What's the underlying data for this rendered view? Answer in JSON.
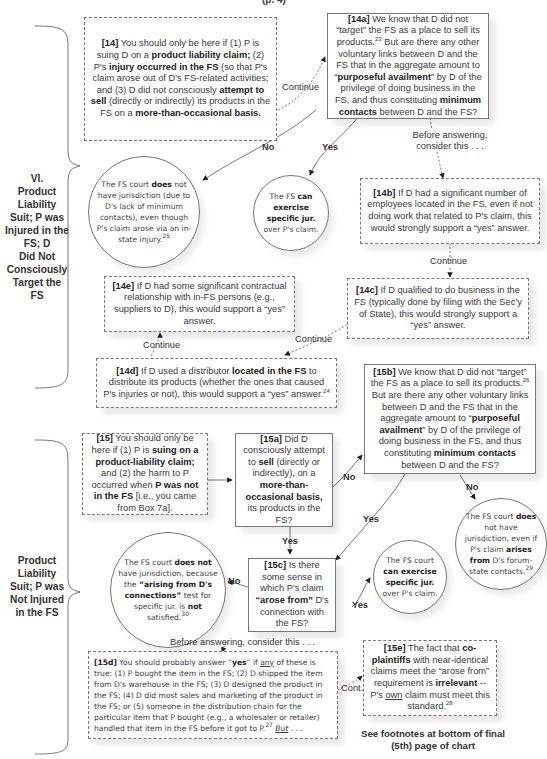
{
  "header": {
    "cut_title": "(p. 4)"
  },
  "sections": [
    {
      "id": "VI",
      "label_lines": [
        "VI.",
        "Product",
        "Liability",
        "Suit; P was",
        "Injured in the",
        "FS; D",
        "Did Not",
        "Consciously",
        "Target the",
        "FS"
      ]
    },
    {
      "id": "unnumbered",
      "label_lines": [
        "Product",
        "Liability",
        "Suit; P was",
        "Not Injured",
        "in the FS"
      ]
    }
  ],
  "boxes": {
    "b14": {
      "id": "[14]",
      "style": "dashed",
      "parts": [
        {
          "t": "[14]",
          "b": true
        },
        {
          "t": " You should only be here if (1) P is suing D on a "
        },
        {
          "t": "product liability claim;",
          "b": true
        },
        {
          "t": " (2) P's "
        },
        {
          "t": "injury occurred in the FS",
          "b": true
        },
        {
          "t": " (so that P's claim arose out of D's FS-related activities; and (3) D did not consciously "
        },
        {
          "t": "attempt to sell",
          "b": true
        },
        {
          "t": " (directly or indirectly) its products in the FS on a "
        },
        {
          "t": "more-than-occasional basis.",
          "b": true
        }
      ]
    },
    "b14a": {
      "id": "[14a]",
      "style": "solid",
      "parts": [
        {
          "t": "[14a]",
          "b": true
        },
        {
          "t": "  We know that D did not “target” the FS as a place to sell its products."
        },
        {
          "t": "23",
          "sup": true
        },
        {
          "t": " But are there any other voluntary links between D and the FS that in the aggregate amount to “"
        },
        {
          "t": "purposeful availment",
          "b": true
        },
        {
          "t": "” by D of the privilege of doing business in the FS, and thus constituting "
        },
        {
          "t": "minimum contacts",
          "b": true
        },
        {
          "t": " between D and the FS?"
        }
      ]
    },
    "b14b": {
      "id": "[14b]",
      "style": "dashed",
      "parts": [
        {
          "t": "[14b]",
          "b": true
        },
        {
          "t": " If D had a significant number of employees located in the FS, even if not doing work that related to P's claim, this would strongly support a “yes” answer."
        }
      ]
    },
    "b14c": {
      "id": "[14c]",
      "style": "dashed",
      "parts": [
        {
          "t": "[14c]",
          "b": true
        },
        {
          "t": " If D qualified to do business in the FS (typically done by filing with the Sec'y of State), this would strongly support a “yes” answer."
        }
      ]
    },
    "b14d": {
      "id": "[14d]",
      "style": "dashed",
      "parts": [
        {
          "t": "[14d]",
          "b": true
        },
        {
          "t": " If D used a distributor "
        },
        {
          "t": "located in the FS",
          "b": true
        },
        {
          "t": " to distribute its products (whether the ones that caused P's injuries or not), this would support a “yes” answer."
        },
        {
          "t": "24",
          "sup": true
        }
      ]
    },
    "b14e": {
      "id": "[14e]",
      "style": "dashed",
      "parts": [
        {
          "t": "[14e]",
          "b": true
        },
        {
          "t": " If D had some significant contractual relationship with in-FS persons (e.g., suppliers to D), this would support a “yes” answer."
        }
      ]
    },
    "b15": {
      "id": "[15]",
      "style": "dashed",
      "parts": [
        {
          "t": "[15]",
          "b": true
        },
        {
          "t": " You should only be here if (1) P is "
        },
        {
          "t": "suing on a product-liability claim;",
          "b": true
        },
        {
          "t": " and (2) the harm to P occurred when "
        },
        {
          "t": "P was not in the FS",
          "b": true
        },
        {
          "t": " [i.e., you came from Box 7a]."
        }
      ]
    },
    "b15a": {
      "id": "[15a]",
      "style": "solid",
      "parts": [
        {
          "t": "[15a]",
          "b": true
        },
        {
          "t": "  Did D consciously attempt to "
        },
        {
          "t": "sell",
          "b": true
        },
        {
          "t": " (directly or indirectly), on a "
        },
        {
          "t": "more-than-occasional basis,",
          "b": true
        },
        {
          "t": " its products in the FS?"
        }
      ]
    },
    "b15b": {
      "id": "[15b]",
      "style": "solid",
      "parts": [
        {
          "t": "[15b]",
          "b": true
        },
        {
          "t": " We know that D did not “target” the FS as a place to sell its products."
        },
        {
          "t": "26",
          "sup": true
        },
        {
          "t": " But are there any other voluntary links between D and the FS that in the aggregate amount to “"
        },
        {
          "t": "purposeful availment",
          "b": true
        },
        {
          "t": "” by D of the privilege of doing business in the FS, and thus constituting "
        },
        {
          "t": "minimum contacts",
          "b": true
        },
        {
          "t": " between D and the FS?"
        }
      ]
    },
    "b15c": {
      "id": "[15c]",
      "style": "solid",
      "parts": [
        {
          "t": "[15c]",
          "b": true
        },
        {
          "t": " Is there some sense in which P's claim "
        },
        {
          "t": "“arose from”",
          "b": true
        },
        {
          "t": " D's connection with the FS?"
        }
      ]
    },
    "b15d": {
      "id": "[15d]",
      "style": "dashed",
      "parts": [
        {
          "t": "[15d]",
          "b": true
        },
        {
          "t": " You should probably answer “"
        },
        {
          "t": "yes",
          "b": true
        },
        {
          "t": "” if "
        },
        {
          "t": "any",
          "u": true
        },
        {
          "t": " of these is true: (1) P bought the item in the FS; (2) D shipped the item from D's warehouse in the FS; (3) D designed the product in the FS; (4) D did most sales and marketing of the product in the FS; or (5) someone in the distribution chain for the particular item that P bought (e.g., a wholesaler or retailer) handled that item in the FS before it got to P."
        },
        {
          "t": "27",
          "sup": true
        },
        {
          "t": " "
        },
        {
          "t": "But",
          "u": true,
          "i": true
        },
        {
          "t": " . . ."
        }
      ]
    },
    "b15e": {
      "id": "[15e]",
      "style": "dashed",
      "parts": [
        {
          "t": "[15e]",
          "b": true
        },
        {
          "t": " The fact that "
        },
        {
          "t": "co-plaintiffs",
          "b": true
        },
        {
          "t": " with near-identical claims meet the “arose from” requirement is "
        },
        {
          "t": "irrelevant",
          "b": true
        },
        {
          "t": " -- P's "
        },
        {
          "t": "own",
          "u": true
        },
        {
          "t": " claim must meet this standard."
        },
        {
          "t": "28",
          "sup": true
        }
      ]
    }
  },
  "circles": {
    "c14no": {
      "parts": [
        {
          "t": "The FS court "
        },
        {
          "t": "does",
          "b": true
        },
        {
          "t": " not have jurisdiction (due to D's lack of minimum contacts), even though P's claim arose via an in-state injury."
        },
        {
          "t": "25",
          "sup": true
        }
      ]
    },
    "c14yes": {
      "parts": [
        {
          "t": "The FS "
        },
        {
          "t": "can exercise specific jur.",
          "b": true
        },
        {
          "t": " over P's claim."
        }
      ]
    },
    "c15bno": {
      "parts": [
        {
          "t": "The FS court "
        },
        {
          "t": "does",
          "b": true
        },
        {
          "t": " not have jurisdiction, even if P's claim "
        },
        {
          "t": "arises from",
          "b": true
        },
        {
          "t": " D's forum-state contacts."
        },
        {
          "t": "29",
          "sup": true
        }
      ]
    },
    "c15yes": {
      "parts": [
        {
          "t": "The FS court "
        },
        {
          "t": "can exercise specific jur.",
          "b": true
        },
        {
          "t": " over P's claim."
        }
      ]
    },
    "c15cno": {
      "parts": [
        {
          "t": "The FS court "
        },
        {
          "t": "does not",
          "b": true
        },
        {
          "t": " have jurisdiction, because the "
        },
        {
          "t": "“arising from D's connections”",
          "b": true
        },
        {
          "t": " test for specific jur. is "
        },
        {
          "t": "not",
          "b": true
        },
        {
          "t": " satisfied."
        },
        {
          "t": "30",
          "sup": true
        }
      ]
    }
  },
  "edge_labels": {
    "continue_14_14a": "Continue",
    "no_14a": "No",
    "yes_14a": "Yes",
    "before_14a": "Before answering, consider this . . .",
    "continue_14b_14c": "Continue",
    "continue_14c_14d": "Continue",
    "continue_14d_14e": "Continue",
    "no_15a": "No",
    "yes_15a": "Yes",
    "yes_15b": "Yes",
    "no_15b": "No",
    "no_15c": "No",
    "yes_15c": "Yes",
    "before_15c": "Before answering, consider this . . .",
    "cont_15d_15e": "Cont."
  },
  "footer": {
    "note": "See footnotes at bottom of final (5th) page of chart"
  }
}
